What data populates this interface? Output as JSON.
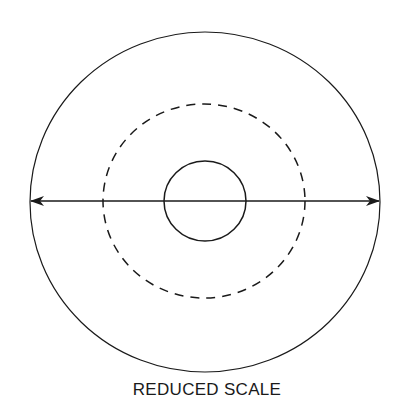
{
  "diagram": {
    "caption": "REDUCED SCALE",
    "stroke_color": "#1a1a1a",
    "background": "#ffffff",
    "shapes": {
      "outer_circle": {
        "cx": 205,
        "cy": 202,
        "rx": 175,
        "ry": 170,
        "style": "solid"
      },
      "middle_circle": {
        "cx": 204,
        "cy": 201,
        "rx": 101,
        "ry": 97,
        "style": "dashed"
      },
      "inner_circle": {
        "cx": 205,
        "cy": 201,
        "rx": 41,
        "ry": 40,
        "style": "solid"
      },
      "diameter_arrow": {
        "x1": 31,
        "x2": 379,
        "y": 201,
        "heads": "both"
      }
    }
  }
}
